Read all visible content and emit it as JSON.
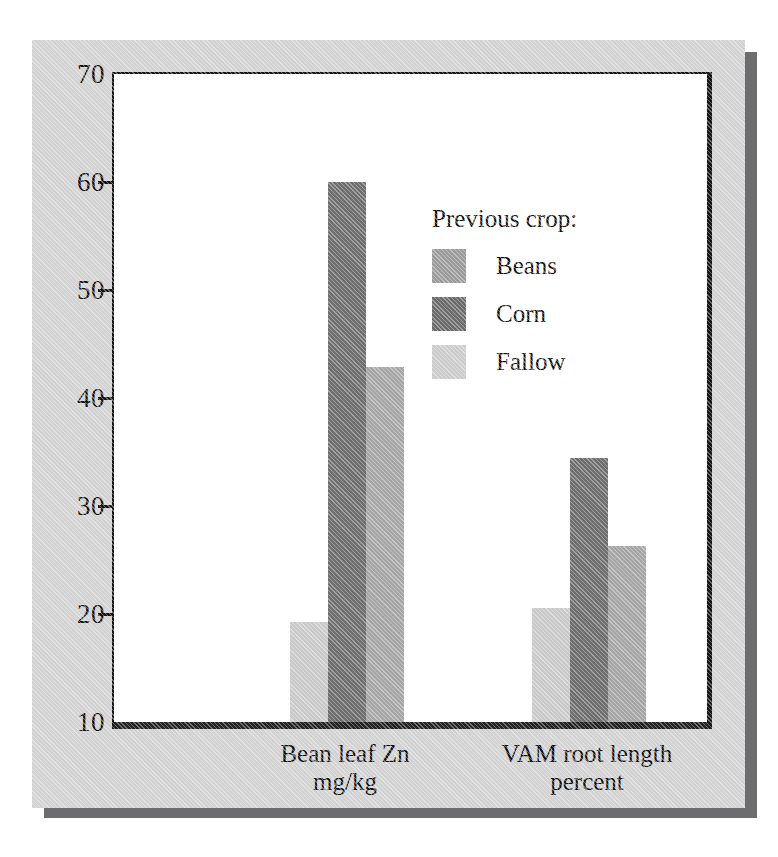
{
  "chart_data": {
    "type": "bar",
    "title": "",
    "xlabel": "",
    "ylabel": "",
    "ylim": [
      10,
      70
    ],
    "ytick_step": 10,
    "yticks": [
      "70",
      "60",
      "50",
      "40",
      "30",
      "20",
      "10"
    ],
    "grid": false,
    "legend_position": "inside-upper-right",
    "legend_title": "Previous crop:",
    "categories": [
      "Bean leaf Zn\nmg/kg",
      "VAM root length\npercent"
    ],
    "category_labels": [
      {
        "line1": "Bean leaf Zn",
        "line2": "mg/kg"
      },
      {
        "line1": "VAM root length",
        "line2": "percent"
      }
    ],
    "series": [
      {
        "name": "Beans",
        "color": "#c9c9c9",
        "values": [
          19.3,
          20.6
        ]
      },
      {
        "name": "Corn",
        "color": "#6e6e6e",
        "values": [
          60.0,
          34.4
        ]
      },
      {
        "name": "Fallow",
        "color": "#a6a6a6",
        "values": [
          42.9,
          26.3
        ]
      }
    ]
  },
  "legend": {
    "title": "Previous crop:",
    "entries": [
      {
        "label": "Beans",
        "swatch_color": "#9b9b9b"
      },
      {
        "label": "Corn",
        "swatch_color": "#6b6b6b"
      },
      {
        "label": "Fallow",
        "swatch_color": "#cccccc"
      }
    ]
  },
  "axis": {
    "y_tick_labels": [
      "70",
      "60",
      "50",
      "40",
      "30",
      "20",
      "10"
    ]
  },
  "x_axis": {
    "groups": [
      {
        "line1": "Bean leaf Zn",
        "line2": "mg/kg"
      },
      {
        "line1": "VAM root length",
        "line2": "percent"
      }
    ]
  },
  "colors": {
    "panel_background": "#d2d2d2",
    "panel_shadow": "#6d6d70",
    "plot_background": "#ffffff",
    "axis_line": "#161616",
    "text": "#111111"
  }
}
